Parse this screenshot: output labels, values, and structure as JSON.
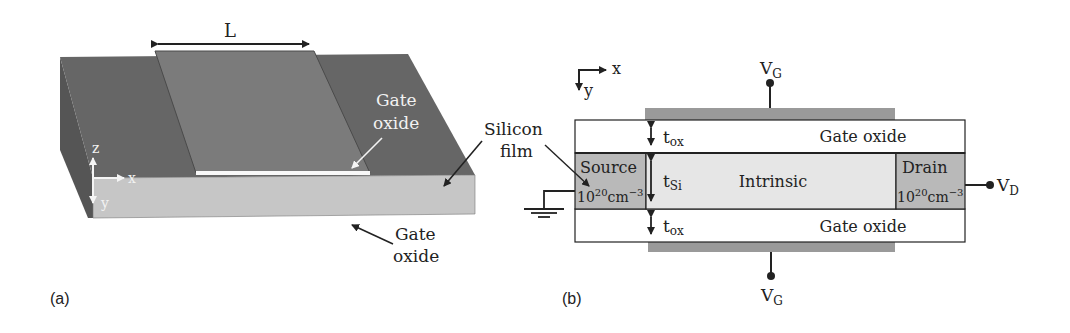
{
  "figure": {
    "panel_a": {
      "caption": "(a)",
      "length_label": "L",
      "gate_oxide_top_label_line1": "Gate",
      "gate_oxide_top_label_line2": "oxide",
      "gate_oxide_bottom_label_line1": "Gate",
      "gate_oxide_bottom_label_line2": "oxide",
      "silicon_film_label_line1": "Silicon",
      "silicon_film_label_line2": "film",
      "axis_z": "z",
      "axis_x": "x",
      "axis_y": "y"
    },
    "panel_b": {
      "caption": "(b)",
      "axis_x": "x",
      "axis_y": "y",
      "top_gate_terminal": "V",
      "top_gate_terminal_sub": "G",
      "bottom_gate_terminal": "V",
      "bottom_gate_terminal_sub": "G",
      "drain_terminal": "V",
      "drain_terminal_sub": "D",
      "top_oxide_label": "Gate oxide",
      "bottom_oxide_label": "Gate oxide",
      "tox_top": "t",
      "tox_top_sub": "ox",
      "tox_bottom": "t",
      "tox_bottom_sub": "ox",
      "tsi": "t",
      "tsi_sub": "Si",
      "source_label": "Source",
      "source_doping_base": "10",
      "source_doping_exp": "20",
      "source_doping_unit": "cm",
      "source_doping_unit_exp": "−3",
      "channel_label": "Intrinsic",
      "drain_label": "Drain",
      "drain_doping_base": "10",
      "drain_doping_exp": "20",
      "drain_doping_unit": "cm",
      "drain_doping_unit_exp": "−3"
    },
    "colors": {
      "gate": "#6e6e6e",
      "slab_side": "#5a5a5a",
      "front_face": "#c4c4c4",
      "doped_region": "#b9b9b9",
      "intrinsic": "#e6e6e6",
      "gate_electrode": "#9a9a9a",
      "line": "#222222"
    }
  }
}
